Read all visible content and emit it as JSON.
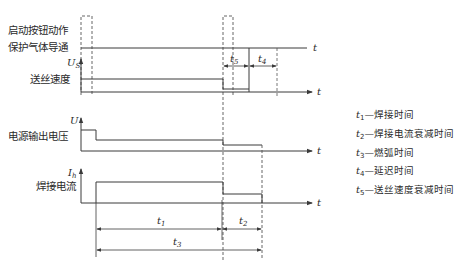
{
  "diagram": {
    "type": "timing-diagram",
    "time_axis_label": "t",
    "signals": [
      {
        "id": "start_gas",
        "label_line1": "启动按钮动作",
        "label_line2": "保护气体导通",
        "axis_symbol": ""
      },
      {
        "id": "wire_feed",
        "label": "送丝速度",
        "axis_symbol": "U",
        "axis_sub": "S"
      },
      {
        "id": "voltage",
        "label": "电源输出电压",
        "axis_symbol": "U",
        "axis_sub": ""
      },
      {
        "id": "current",
        "label": "焊接电流",
        "axis_symbol": "I",
        "axis_sub": "h"
      }
    ],
    "intervals": {
      "t1": {
        "sym": "t",
        "sub": "1"
      },
      "t2": {
        "sym": "t",
        "sub": "2"
      },
      "t3": {
        "sym": "t",
        "sub": "3"
      },
      "t4": {
        "sym": "t",
        "sub": "4"
      },
      "t5": {
        "sym": "t",
        "sub": "5"
      }
    },
    "legend": [
      {
        "sym": "t",
        "sub": "1",
        "text": "—焊接时间"
      },
      {
        "sym": "t",
        "sub": "2",
        "text": "—焊接电流衰减时间"
      },
      {
        "sym": "t",
        "sub": "3",
        "text": "—燃弧时间"
      },
      {
        "sym": "t",
        "sub": "4",
        "text": "—延迟时间"
      },
      {
        "sym": "t",
        "sub": "5",
        "text": "—送丝速度衰减时间"
      }
    ],
    "colors": {
      "line": "#3a3a3a",
      "dash": "#555555",
      "background": "#ffffff"
    }
  }
}
